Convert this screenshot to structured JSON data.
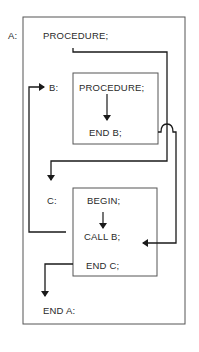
{
  "diagram": {
    "outer_block": {
      "label": "A:",
      "header": "PROCEDURE;",
      "footer": "END A:"
    },
    "block_b": {
      "label": "B:",
      "header": "PROCEDURE;",
      "footer": "END B;"
    },
    "block_c": {
      "label": "C:",
      "header": "BEGIN;",
      "middle": "CALL B;",
      "footer": "END C;"
    },
    "colors": {
      "line": "#1a1a1a",
      "box": "#555555",
      "text": "#2a2a2a"
    }
  }
}
